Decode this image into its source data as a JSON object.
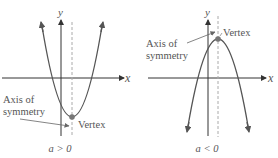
{
  "panels": [
    {
      "id": "upward",
      "y_axis_label": "y",
      "x_axis_label": "x",
      "axis_of_symmetry_line1": "Axis of",
      "axis_of_symmetry_line2": "symmetry",
      "vertex_label": "Vertex",
      "caption": "a > 0"
    },
    {
      "id": "downward",
      "y_axis_label": "y",
      "x_axis_label": "x",
      "axis_of_symmetry_line1": "Axis of",
      "axis_of_symmetry_line2": "symmetry",
      "vertex_label": "Vertex",
      "caption": "a < 0"
    }
  ],
  "colors": {
    "axis": "#333333",
    "curve": "#555555",
    "dashed": "#aaaaaa",
    "vertex": "#777777",
    "text": "#555555"
  }
}
